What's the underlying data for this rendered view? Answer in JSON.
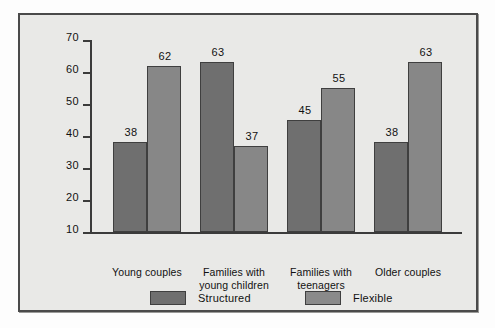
{
  "chart_data": {
    "type": "bar",
    "title": "",
    "subtitle": "",
    "xlabel": "",
    "ylabel": "",
    "ylim": [
      10,
      70
    ],
    "yticks": [
      10,
      20,
      30,
      40,
      50,
      60,
      70
    ],
    "grid": false,
    "legend_position": "bottom",
    "categories": [
      "Young couples",
      "Families with\nyoung children",
      "Families with\nteenagers",
      "Older couples"
    ],
    "series": [
      {
        "name": "Structured",
        "color": "#6f6f6f",
        "values": [
          38,
          63,
          45,
          38
        ]
      },
      {
        "name": "Flexible",
        "color": "#8a8a8a",
        "values": [
          62,
          37,
          55,
          63
        ]
      }
    ]
  },
  "axis": {
    "ticks": [
      {
        "value": 70,
        "label": "70"
      },
      {
        "value": 60,
        "label": "60"
      },
      {
        "value": 50,
        "label": "50"
      },
      {
        "value": 40,
        "label": "40"
      },
      {
        "value": 30,
        "label": "30"
      },
      {
        "value": 20,
        "label": "20"
      },
      {
        "value": 10,
        "label": "10"
      }
    ]
  },
  "bars": [
    {
      "group": 0,
      "series": "Structured",
      "label": "38"
    },
    {
      "group": 0,
      "series": "Flexible",
      "label": "62"
    },
    {
      "group": 1,
      "series": "Structured",
      "label": "63"
    },
    {
      "group": 1,
      "series": "Flexible",
      "label": "37"
    },
    {
      "group": 2,
      "series": "Structured",
      "label": "45"
    },
    {
      "group": 2,
      "series": "Flexible",
      "label": "55"
    },
    {
      "group": 3,
      "series": "Structured",
      "label": "38"
    },
    {
      "group": 3,
      "series": "Flexible",
      "label": "63"
    }
  ],
  "legend": {
    "structured_label": "Structured",
    "flexible_label": "Flexible"
  },
  "colors": {
    "structured": "#6f6f6f",
    "flexible": "#8a8a8a",
    "frame": "#4a4a4a",
    "background": "#e9e9e7",
    "axis": "#3b3b3b"
  }
}
